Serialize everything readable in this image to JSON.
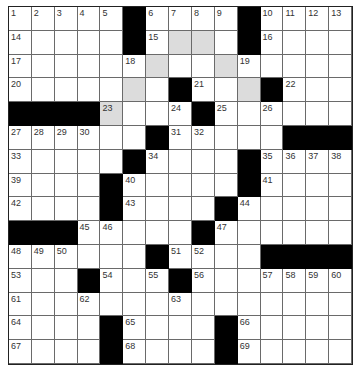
{
  "puzzle": {
    "rows": 15,
    "cols": 15,
    "colors": {
      "block": "#000000",
      "shaded": "#dcdcdc",
      "open": "#ffffff",
      "grid_line": "#6a6a6a"
    },
    "layout": [
      "1234#5678#9ABC",
      "placeholder"
    ],
    "grid": [
      [
        "1",
        "2",
        "3",
        "4",
        "5",
        "#",
        "6",
        "7",
        "8",
        "9",
        "#",
        "10",
        "11",
        "12",
        "13"
      ],
      [
        "14",
        ".",
        ".",
        ".",
        ".",
        "#",
        "15",
        "*",
        "*",
        ".",
        "#",
        "16",
        ".",
        ".",
        "."
      ],
      [
        "17",
        ".",
        ".",
        ".",
        ".",
        "18",
        "*",
        ".",
        ".",
        "*",
        "19",
        ".",
        ".",
        ".",
        "."
      ],
      [
        "20",
        ".",
        ".",
        ".",
        ".",
        "*",
        ".",
        "#",
        "21",
        ".",
        "*",
        "#",
        "22",
        ".",
        "."
      ],
      [
        "#",
        "#",
        "#",
        "#",
        "23*",
        ".",
        ".",
        "24",
        "#",
        "25",
        ".",
        "26",
        ".",
        ".",
        "."
      ],
      [
        "27",
        "28",
        "29",
        "30",
        ".",
        ".",
        "#",
        "31",
        "32",
        ".",
        ".",
        ".",
        "#",
        "#",
        "#"
      ],
      [
        "33",
        ".",
        ".",
        ".",
        ".",
        "#",
        "34",
        ".",
        ".",
        ".",
        "#",
        "35",
        "36",
        "37",
        "38"
      ],
      [
        "39",
        ".",
        ".",
        ".",
        "#",
        "40",
        ".",
        ".",
        ".",
        ".",
        "#",
        "41",
        ".",
        ".",
        "."
      ],
      [
        "42",
        ".",
        ".",
        ".",
        "#",
        "43",
        ".",
        ".",
        ".",
        "#",
        "44",
        ".",
        ".",
        ".",
        "."
      ],
      [
        "#",
        "#",
        "#",
        "45",
        "46",
        ".",
        ".",
        ".",
        "#",
        "47",
        ".",
        ".",
        ".",
        ".",
        "."
      ],
      [
        "48",
        "49",
        "50",
        ".",
        ".",
        ".",
        "#",
        "51",
        "52",
        ".",
        ".",
        "#",
        "#",
        "#",
        "#"
      ],
      [
        "53",
        ".",
        ".",
        "#",
        "54",
        ".",
        "55",
        "#",
        "56",
        ".",
        ".",
        "57",
        "58",
        "59",
        "60"
      ],
      [
        "61",
        ".",
        ".",
        "62",
        ".",
        ".",
        ".",
        "63",
        ".",
        ".",
        ".",
        ".",
        ".",
        ".",
        "."
      ],
      [
        "64",
        ".",
        ".",
        ".",
        "#",
        "65",
        ".",
        ".",
        ".",
        "#",
        "66",
        ".",
        ".",
        ".",
        "."
      ],
      [
        "67",
        ".",
        ".",
        ".",
        "#",
        "68",
        ".",
        ".",
        ".",
        "#",
        "69",
        ".",
        ".",
        ".",
        "."
      ]
    ],
    "legend": {
      "#": "black block",
      ".": "open cell",
      "*": "shaded open cell",
      "N": "numbered open cell",
      "N*": "numbered shaded open cell"
    }
  }
}
